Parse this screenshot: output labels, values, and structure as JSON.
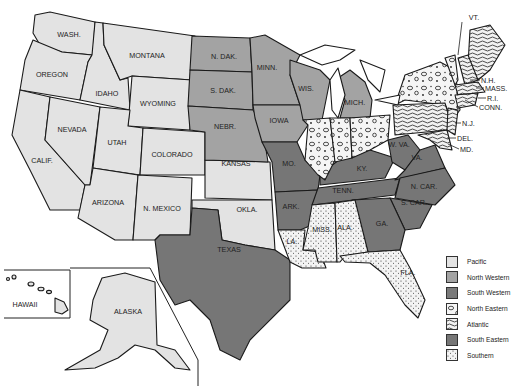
{
  "map": {
    "title": "",
    "colors": {
      "pacific": "#e3e3e3",
      "north_western": "#a3a3a3",
      "south_western": "#7a7a7a",
      "north_eastern": "#f4f4f4",
      "atlantic": "#efefef",
      "south_eastern": "#767676",
      "southern": "#f1f1f1"
    },
    "states": {
      "wash": "WASH.",
      "oregon": "OREGON",
      "calif": "CALIF.",
      "idaho": "IDAHO",
      "nevada": "NEVADA",
      "montana": "MONTANA",
      "wyoming": "WYOMING",
      "utah": "UTAH",
      "colorado": "COLORADO",
      "arizona": "ARIZONA",
      "n_mexico": "N. MEXICO",
      "kansas": "KANSAS",
      "okla": "OKLA.",
      "n_dak": "N. DAK.",
      "s_dak": "S. DAK.",
      "nebr": "NEBR.",
      "minn": "MINN.",
      "iowa": "IOWA",
      "wis": "WIS.",
      "mich": "MICH.",
      "texas": "TEXAS",
      "mo": "MO.",
      "ark": "ARK.",
      "ky": "KY.",
      "tenn": "TENN.",
      "w_va": "W. VA.",
      "va": "VA.",
      "n_car": "N. CAR.",
      "s_car": "S. CAR.",
      "ga": "GA.",
      "la": "LA.",
      "miss": "MISS.",
      "ala": "ALA.",
      "fla": "FLA.",
      "ill": "ILL.",
      "ind": "IND.",
      "ohio": "OHIO",
      "ny": "N.Y.",
      "pa": "PA.",
      "me": "ME.",
      "vt": "VT.",
      "nh": "N.H.",
      "mass": "MASS.",
      "ri": "R.I.",
      "conn": "CONN.",
      "nj": "N.J.",
      "del": "DEL.",
      "md": "MD.",
      "hawaii": "HAWAII",
      "alaska": "ALASKA"
    }
  },
  "legend": {
    "items": [
      {
        "label": "Pacific",
        "pattern": "solid-light"
      },
      {
        "label": "North Western",
        "pattern": "solid-medium"
      },
      {
        "label": "South Western",
        "pattern": "solid-dark"
      },
      {
        "label": "North Eastern",
        "pattern": "circles"
      },
      {
        "label": "Atlantic",
        "pattern": "waves"
      },
      {
        "label": "South Eastern",
        "pattern": "solid-dark"
      },
      {
        "label": "Southern",
        "pattern": "dots"
      }
    ]
  }
}
